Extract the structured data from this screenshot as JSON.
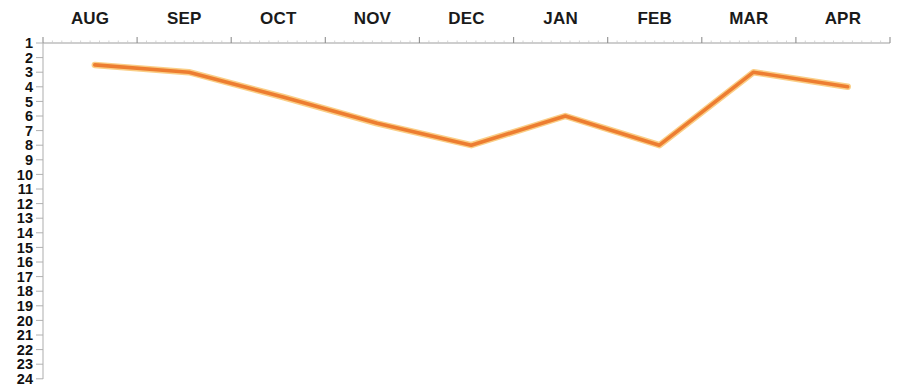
{
  "chart_data": {
    "type": "line",
    "title": "",
    "subtitle": "",
    "xlabel": "",
    "ylabel": "",
    "categories": [
      "AUG",
      "SEP",
      "OCT",
      "NOV",
      "DEC",
      "JAN",
      "FEB",
      "MAR",
      "APR"
    ],
    "series": [
      {
        "name": "Rank",
        "color": "#ED7D31",
        "values": [
          2.5,
          3,
          4.7,
          6.5,
          8,
          6,
          8,
          3,
          4
        ]
      }
    ],
    "ytick_labels": [
      "1",
      "2",
      "3",
      "4",
      "5",
      "6",
      "7",
      "8",
      "9",
      "10",
      "11",
      "12",
      "13",
      "14",
      "15",
      "16",
      "17",
      "18",
      "19",
      "20",
      "21",
      "22",
      "23",
      "24"
    ],
    "ylim": [
      1,
      24
    ],
    "y_inverted": true,
    "x_axis_position": "top",
    "grid": false,
    "legend": "none",
    "line_color": "#ED7D31",
    "axis_color": "#9e9e9e"
  }
}
